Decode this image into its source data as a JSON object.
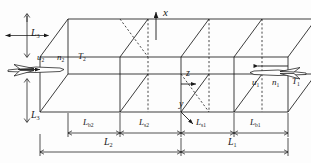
{
  "figure": {
    "type": "3d-oblique-box-schematic",
    "line_color": "#1a1a1a",
    "background": "#fdfdfd"
  },
  "axes": {
    "x": {
      "label": "x",
      "arrow": "up"
    },
    "y": {
      "label": "y",
      "arrow": "down-left"
    },
    "z": {
      "label": "z",
      "arrow": "right"
    }
  },
  "flow_left": {
    "icon": "aircraft-icon",
    "arrow": "right",
    "params": [
      {
        "symbol": "u",
        "sub": "2"
      },
      {
        "symbol": "n",
        "sub": "2"
      },
      {
        "symbol": "T",
        "sub": "2"
      }
    ]
  },
  "flow_right": {
    "icon": "aircraft-icon",
    "arrow": "left",
    "params": [
      {
        "symbol": "u",
        "sub": "1"
      },
      {
        "symbol": "n",
        "sub": "1"
      },
      {
        "symbol": "T",
        "sub": "1"
      }
    ]
  },
  "dimensions": {
    "height_label": {
      "symbol": "L",
      "sub": "3"
    },
    "depth_label": {
      "symbol": "L",
      "sub": "3"
    },
    "segments": [
      {
        "symbol": "L",
        "sub": "b2"
      },
      {
        "symbol": "L",
        "sub": "s2"
      },
      {
        "symbol": "L",
        "sub": "s1"
      },
      {
        "symbol": "L",
        "sub": "b1"
      }
    ],
    "totals": [
      {
        "symbol": "L",
        "sub": "2"
      },
      {
        "symbol": "L",
        "sub": "1"
      }
    ]
  }
}
